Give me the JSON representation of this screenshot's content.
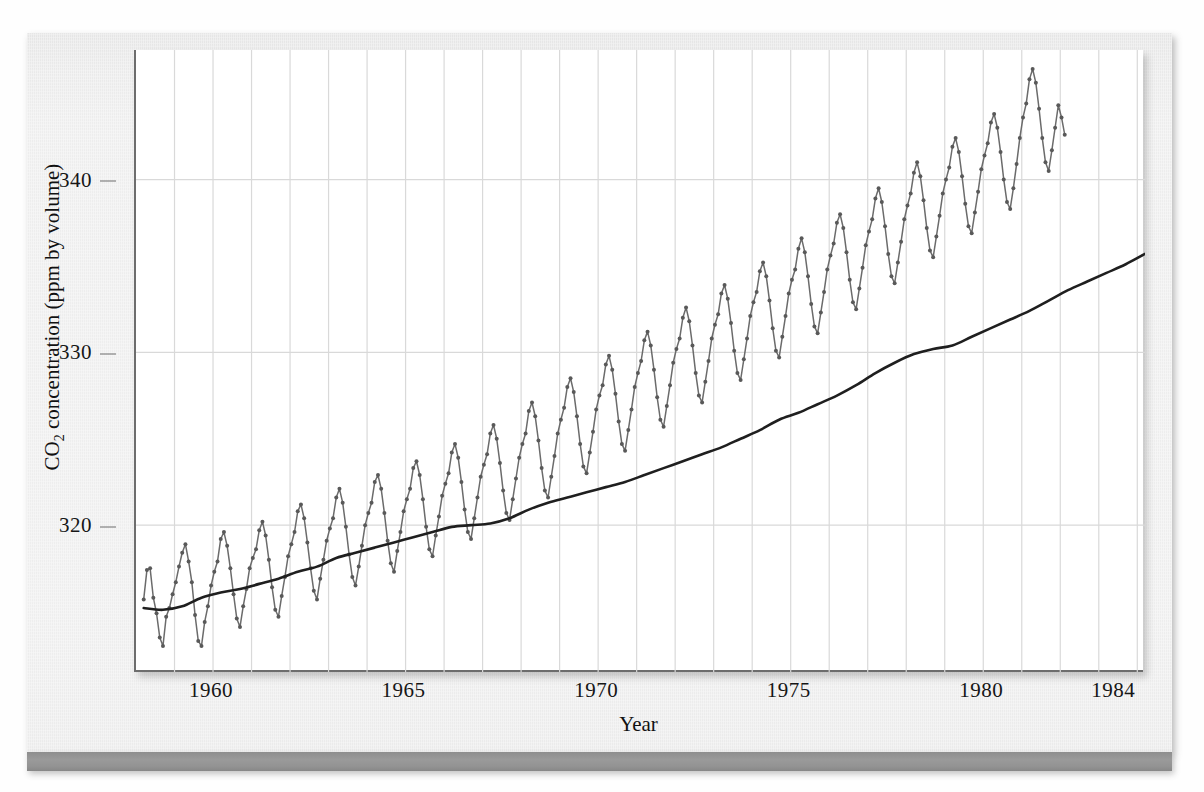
{
  "figure": {
    "kind": "scanned-textbook-figure",
    "colors": {
      "page_background": "#f1f1f1",
      "plot_background": "#ffffff",
      "axis": "#6d6d6d",
      "gridline": "#d9d9d9",
      "marker": "#595959",
      "series_line": "#6b6b6b",
      "trend_line": "#1f1f1f",
      "rule_bar": "#939393",
      "text": "#141414"
    }
  },
  "chart_data": {
    "type": "line",
    "title": "",
    "subtitle": "",
    "xlabel": "Year",
    "ylabel": "CO2 concentration (ppm by volume)",
    "ylabel_rich": {
      "prefix": "CO",
      "sub": "2",
      "suffix": " concentration (ppm by volume)"
    },
    "xlim": [
      1958.0,
      1984.2
    ],
    "ylim": [
      311.5,
      347.5
    ],
    "xticks": [
      1960,
      1965,
      1970,
      1975,
      1980,
      1984
    ],
    "xticklabels": [
      "1960",
      "1965",
      "1970",
      "1975",
      "1980",
      "1984"
    ],
    "yticks": [
      320,
      330,
      340
    ],
    "yticklabels": [
      "320",
      "330",
      "340"
    ],
    "grid": {
      "vertical": "every year",
      "horizontal": "at y ticks",
      "color": "#d9d9d9"
    },
    "legend": {
      "visible": false
    },
    "series": [
      {
        "name": "Monthly mean CO2 (Mauna Loa)",
        "style": "line-with-circle-markers",
        "marker": "circle",
        "marker_size_px": 4,
        "x_start": 1958.2,
        "x_step_years": 0.08333,
        "note": "monthly observations, seasonal cycle amplitude ~6 ppm",
        "values": [
          315.7,
          317.4,
          317.5,
          315.8,
          314.9,
          313.5,
          313.0,
          314.7,
          315.2,
          316.0,
          316.7,
          317.6,
          318.4,
          318.9,
          317.9,
          316.7,
          314.8,
          313.3,
          313.0,
          314.4,
          315.3,
          316.5,
          317.3,
          317.9,
          319.2,
          319.6,
          318.8,
          317.5,
          316.0,
          314.6,
          314.1,
          315.3,
          316.3,
          317.5,
          318.1,
          318.6,
          319.7,
          320.2,
          319.4,
          318.0,
          316.4,
          315.1,
          314.7,
          315.9,
          317.0,
          318.2,
          318.9,
          319.6,
          320.8,
          321.2,
          320.4,
          319.0,
          317.5,
          316.2,
          315.7,
          316.9,
          318.0,
          319.1,
          319.8,
          320.4,
          321.6,
          322.1,
          321.3,
          319.9,
          318.3,
          317.0,
          316.5,
          317.6,
          318.8,
          320.0,
          320.7,
          321.3,
          322.5,
          322.9,
          322.1,
          320.7,
          319.1,
          317.8,
          317.3,
          318.5,
          319.6,
          320.8,
          321.5,
          322.1,
          323.3,
          323.7,
          322.9,
          321.5,
          319.9,
          318.6,
          318.2,
          319.4,
          320.5,
          321.7,
          322.4,
          323.0,
          324.2,
          324.7,
          323.9,
          322.5,
          320.9,
          319.6,
          319.2,
          320.4,
          321.6,
          322.8,
          323.5,
          324.1,
          325.3,
          325.8,
          325.0,
          323.6,
          322.0,
          320.7,
          320.3,
          321.5,
          322.7,
          323.9,
          324.7,
          325.3,
          326.6,
          327.1,
          326.3,
          324.9,
          323.3,
          322.0,
          321.6,
          322.8,
          324.0,
          325.3,
          326.1,
          326.8,
          328.0,
          328.5,
          327.7,
          326.3,
          324.7,
          323.4,
          323.0,
          324.2,
          325.4,
          326.7,
          327.5,
          328.1,
          329.3,
          329.8,
          329.0,
          327.6,
          326.0,
          324.7,
          324.3,
          325.5,
          326.7,
          328.0,
          328.8,
          329.5,
          330.7,
          331.2,
          330.4,
          329.0,
          327.4,
          326.1,
          325.7,
          326.9,
          328.1,
          329.4,
          330.2,
          330.8,
          332.0,
          332.6,
          331.8,
          330.4,
          328.8,
          327.5,
          327.1,
          328.3,
          329.5,
          330.8,
          331.6,
          332.2,
          333.4,
          333.9,
          333.1,
          331.7,
          330.1,
          328.8,
          328.4,
          329.6,
          330.8,
          332.1,
          332.9,
          333.5,
          334.7,
          335.2,
          334.4,
          333.0,
          331.4,
          330.1,
          329.7,
          330.9,
          332.1,
          333.4,
          334.2,
          334.8,
          336.0,
          336.6,
          335.8,
          334.4,
          332.8,
          331.5,
          331.1,
          332.3,
          333.5,
          334.8,
          335.6,
          336.3,
          337.5,
          338.0,
          337.2,
          335.8,
          334.2,
          332.9,
          332.5,
          333.7,
          334.9,
          336.2,
          337.0,
          337.7,
          338.9,
          339.5,
          338.7,
          337.3,
          335.7,
          334.4,
          334.0,
          335.2,
          336.4,
          337.7,
          338.5,
          339.2,
          340.4,
          341.0,
          340.2,
          338.8,
          337.2,
          335.9,
          335.5,
          336.7,
          337.9,
          339.2,
          340.0,
          340.7,
          341.9,
          342.4,
          341.6,
          340.2,
          338.6,
          337.3,
          336.9,
          338.1,
          339.3,
          340.6,
          341.4,
          342.1,
          343.3,
          343.8,
          343.0,
          341.6,
          340.0,
          338.7,
          338.3,
          339.5,
          340.9,
          342.4,
          343.6,
          344.4,
          345.8,
          346.4,
          345.6,
          344.1,
          342.4,
          341.0,
          340.5,
          341.7,
          343.0,
          344.3,
          343.6,
          342.6
        ]
      },
      {
        "name": "Smoothed trend (annual-averaged)",
        "style": "smooth-line",
        "marker": "none",
        "x_start": 1958.2,
        "x_step_years": 0.5,
        "values": [
          315.2,
          315.1,
          315.3,
          315.8,
          316.1,
          316.3,
          316.6,
          316.9,
          317.3,
          317.6,
          318.1,
          318.4,
          318.7,
          319.0,
          319.3,
          319.6,
          319.9,
          320.0,
          320.1,
          320.4,
          320.9,
          321.3,
          321.6,
          321.9,
          322.2,
          322.5,
          322.9,
          323.3,
          323.7,
          324.1,
          324.5,
          325.0,
          325.5,
          326.1,
          326.5,
          327.0,
          327.5,
          328.1,
          328.8,
          329.4,
          329.9,
          330.2,
          330.4,
          330.9,
          331.4,
          331.9,
          332.4,
          333.0,
          333.6,
          334.1,
          334.6,
          335.1,
          335.7,
          336.3,
          336.8,
          337.3,
          337.7,
          338.1,
          338.6,
          339.3,
          340.0,
          340.6,
          341.1,
          341.5,
          342.0,
          342.6,
          343.2,
          343.6
        ]
      }
    ]
  }
}
